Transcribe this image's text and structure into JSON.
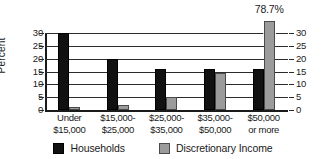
{
  "chart_data": {
    "type": "bar",
    "title": "",
    "xlabel": "",
    "ylabel": "Percent",
    "ylim": [
      0,
      30
    ],
    "yticks": [
      0,
      5,
      10,
      15,
      20,
      25,
      30
    ],
    "grid": true,
    "legend_position": "bottom",
    "dual_axis": true,
    "axis_break_note": "Gray bar for $50,000 or more is truncated with an axis break; its true value is 78.7%",
    "categories": [
      "Under $15,000",
      "$15,000-$25,000",
      "$25,000-$35,000",
      "$35,000-$50,000",
      "$50,000 or more"
    ],
    "category_lines": [
      [
        "Under",
        "$15,000"
      ],
      [
        "$15,000-",
        "$25,000"
      ],
      [
        "$25,000-",
        "$35,000"
      ],
      [
        "$35,000-",
        "$50,000"
      ],
      [
        "$50,000",
        "or more"
      ]
    ],
    "series": [
      {
        "name": "Households",
        "color": "#111111",
        "values": [
          30,
          20,
          16,
          16,
          16
        ]
      },
      {
        "name": "Discretionary Income",
        "color": "#9b9b9b",
        "values": [
          1,
          2,
          5,
          14.5,
          78.7
        ]
      }
    ],
    "annotations": [
      {
        "text": "78.7%",
        "category": "$50,000 or more",
        "series": "Discretionary Income"
      }
    ]
  },
  "axes": {
    "left_ticks": [
      "30",
      "25",
      "20",
      "15",
      "10",
      "5",
      "0"
    ],
    "right_ticks": [
      "30",
      "25",
      "20",
      "15",
      "10",
      "5",
      "0"
    ],
    "y_axis_title": "Percent"
  },
  "legend": {
    "items": [
      {
        "label": "Households",
        "color": "#111111"
      },
      {
        "label": "Discretionary Income",
        "color": "#9b9b9b"
      }
    ]
  }
}
